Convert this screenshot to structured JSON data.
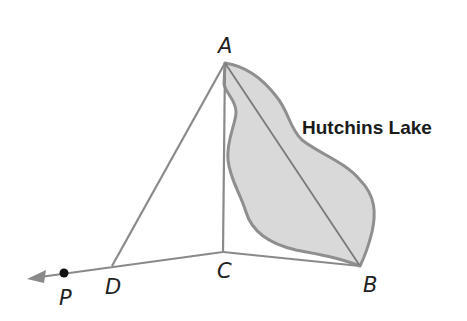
{
  "diagram": {
    "type": "geometry-figure",
    "colors": {
      "line": "#8a8a8a",
      "lake_fill": "#d9d9d9",
      "lake_stroke": "#8f8f8f",
      "point": "#111111",
      "text": "#222222"
    },
    "points": {
      "A": {
        "label": "A",
        "x": 225,
        "y": 63
      },
      "B": {
        "label": "B",
        "x": 360,
        "y": 266
      },
      "C": {
        "label": "C",
        "x": 223,
        "y": 252
      },
      "D": {
        "label": "D",
        "x": 112,
        "y": 266
      },
      "P": {
        "label": "P",
        "x": 64,
        "y": 273
      }
    },
    "segments": [
      "AD",
      "AC",
      "AB",
      "CB",
      "DC"
    ],
    "ray": {
      "from": "C",
      "through": "D",
      "direction": "left",
      "arrowhead": true
    },
    "region": {
      "label": "Hutchins Lake",
      "shape": "irregular-lake"
    },
    "lake_label": "Hutchins Lake"
  }
}
